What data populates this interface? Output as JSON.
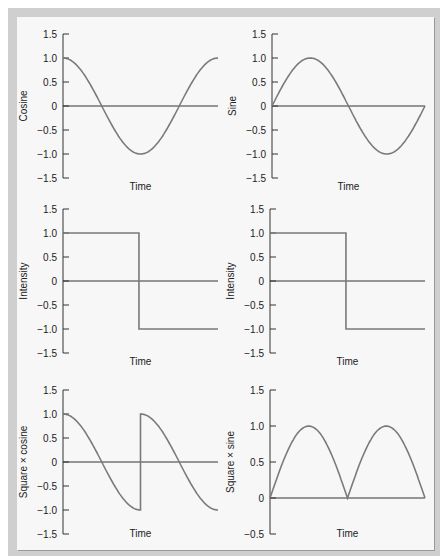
{
  "chart_data": [
    {
      "type": "line",
      "title": "",
      "xlabel": "Time",
      "ylabel": "Cosine",
      "ylim": [
        -1.5,
        1.5
      ],
      "yticks": [
        "1.5",
        "1.0",
        "0.5",
        "0",
        "-0.5",
        "-1.0",
        "-1.5"
      ],
      "series": [
        {
          "name": "cosine",
          "function": "cos(t), t in [0, 2π]"
        }
      ]
    },
    {
      "type": "line",
      "title": "",
      "xlabel": "Time",
      "ylabel": "Sine",
      "ylim": [
        -1.5,
        1.5
      ],
      "yticks": [
        "1.5",
        "1.0",
        "0.5",
        "0",
        "-0.5",
        "-1.0",
        "-1.5"
      ],
      "series": [
        {
          "name": "sine",
          "function": "sin(t), t in [0, 2π]"
        }
      ]
    },
    {
      "type": "line",
      "title": "",
      "xlabel": "Time",
      "ylabel": "Intensity",
      "ylim": [
        -1.5,
        1.5
      ],
      "yticks": [
        "1.5",
        "1.0",
        "0.5",
        "0",
        "-0.5",
        "-1.0",
        "-1.5"
      ],
      "series": [
        {
          "name": "square",
          "x": [
            0,
            0.5,
            0.5,
            1
          ],
          "values": [
            1,
            1,
            -1,
            -1
          ]
        }
      ]
    },
    {
      "type": "line",
      "title": "",
      "xlabel": "Time",
      "ylabel": "Intensity",
      "ylim": [
        -1.5,
        1.5
      ],
      "yticks": [
        "1.5",
        "1.0",
        "0.5",
        "0",
        "-0.5",
        "-1.0",
        "-1.5"
      ],
      "series": [
        {
          "name": "square",
          "x": [
            0,
            0.5,
            0.5,
            1
          ],
          "values": [
            1,
            1,
            -1,
            -1
          ]
        }
      ]
    },
    {
      "type": "line",
      "title": "",
      "xlabel": "Time",
      "ylabel": "Square × cosine",
      "ylim": [
        -1.5,
        1.5
      ],
      "yticks": [
        "1.5",
        "1.0",
        "0.5",
        "0",
        "-0.5",
        "-1.0",
        "-1.5"
      ],
      "series": [
        {
          "name": "square×cosine",
          "function": "sign-flipped cos(t) at t=π"
        }
      ]
    },
    {
      "type": "line",
      "title": "",
      "xlabel": "Time",
      "ylabel": "Square × sine",
      "ylim": [
        -0.5,
        1.5
      ],
      "yticks": [
        "1.5",
        "1.0",
        "0.5",
        "0",
        "-0.5"
      ],
      "series": [
        {
          "name": "square×sine",
          "function": "|sin(t)|, t in [0, 2π]"
        }
      ]
    }
  ],
  "labels": {
    "time": "Time",
    "p1_y": "Cosine",
    "p2_y": "Sine",
    "p3_y": "Intensity",
    "p4_y": "Intensity",
    "p5_y": "Square × cosine",
    "p6_y": "Square × sine",
    "t15": "1.5",
    "t10": "1.0",
    "t05": "0.5",
    "t0": "0",
    "tm05": "−0.5",
    "tm10": "−1.0",
    "tm15": "−1.5"
  },
  "colors": {
    "curve": "#7a7a7a",
    "axis": "#333333",
    "background": "#f7f7f7",
    "frame": "#cfcfcf"
  }
}
